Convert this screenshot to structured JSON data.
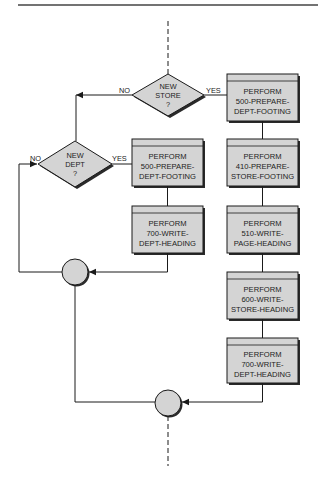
{
  "colors": {
    "shape_fill": "#d4d4d4",
    "header_fill": "#cfcfcf",
    "stroke": "#1a1a1a",
    "shadow": "#2a2a2a",
    "rule": "#333333"
  },
  "diagram": {
    "decisions": [
      {
        "id": "new-store",
        "lines": [
          "NEW",
          "STORE",
          "?"
        ],
        "no_label": "NO",
        "yes_label": "YES"
      },
      {
        "id": "new-dept",
        "lines": [
          "NEW",
          "DEPT",
          "?"
        ],
        "no_label": "NO",
        "yes_label": "YES"
      }
    ],
    "left_column": [
      {
        "lines": [
          "PERFORM",
          "500-PREPARE-",
          "DEPT-FOOTING"
        ]
      },
      {
        "lines": [
          "PERFORM",
          "700-WRITE-",
          "DEPT-HEADING"
        ]
      }
    ],
    "right_column": [
      {
        "lines": [
          "PERFORM",
          "500-PREPARE-",
          "DEPT-FOOTING"
        ]
      },
      {
        "lines": [
          "PERFORM",
          "410-PREPARE-",
          "STORE-FOOTING"
        ]
      },
      {
        "lines": [
          "PERFORM",
          "510-WRITE-",
          "PAGE-HEADING"
        ]
      },
      {
        "lines": [
          "PERFORM",
          "600-WRITE-",
          "STORE-HEADING"
        ]
      },
      {
        "lines": [
          "PERFORM",
          "700-WRITE-",
          "DEPT-HEADING"
        ]
      }
    ],
    "connectors": [
      {
        "id": "dept-join"
      },
      {
        "id": "store-join"
      }
    ]
  }
}
